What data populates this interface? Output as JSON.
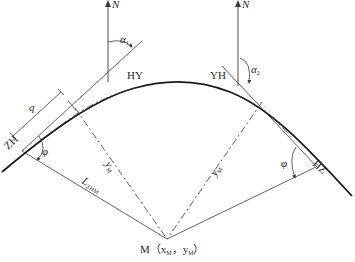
{
  "diagram": {
    "title": "",
    "colors": {
      "line": "#3a3a3a",
      "curve": "#1a1a1a",
      "text": "#2a2a2a",
      "background": "#ffffff"
    },
    "labels": {
      "north_left": "N",
      "north_right": "N",
      "alpha1": "α",
      "alpha1_sub": "1",
      "alpha2": "α",
      "alpha2_sub": "2",
      "hy": "HY",
      "yh": "YH",
      "zh": "ZH",
      "hz": "HZ",
      "q": "q",
      "phi_left": "φ",
      "phi_right": "φ",
      "y_m_left": "y",
      "y_m_left_sub": "M",
      "y_m_right": "y",
      "y_m_right_sub": "M",
      "l_zhm": "L",
      "l_zhm_sub": "ZHM",
      "center_point": "M（x",
      "center_point_sub1": "M",
      "center_point_mid": "，y",
      "center_point_sub2": "M",
      "center_point_end": "）"
    },
    "points": {
      "ZH": [
        22,
        151
      ],
      "HY": [
        135,
        88
      ],
      "YH": [
        230,
        92
      ],
      "HZ": [
        316,
        167
      ],
      "M": [
        167,
        239
      ]
    }
  }
}
